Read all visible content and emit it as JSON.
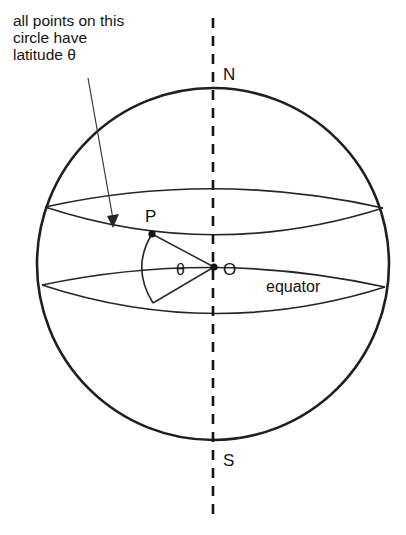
{
  "figure": {
    "type": "geometry-diagram",
    "annotation": {
      "line1": "all points on this",
      "line2": "circle have",
      "line3": "latitude θ"
    },
    "labels": {
      "north_pole": "N",
      "south_pole": "S",
      "point_p": "P",
      "center_o": "O",
      "angle": "θ",
      "equator": "equator"
    },
    "colors": {
      "background": "#ffffff",
      "outline": "#1f1f1f",
      "construction": "#262626",
      "text": "#141414",
      "leader": "#3a3a3a"
    },
    "geometry": {
      "sphere_center_x": 213,
      "sphere_center_y": 264,
      "sphere_radius": 176,
      "axis_x": 213,
      "axis_top_y": 18,
      "axis_bottom_y": 520,
      "point_p_x": 152,
      "point_p_y": 234,
      "center_o_x": 214,
      "center_o_y": 267,
      "lower_point_x": 152,
      "lower_point_y": 303,
      "latitude_left_x": 45,
      "latitude_left_y": 207,
      "latitude_right_x": 383,
      "latitude_right_y": 208,
      "equator_left_x": 42,
      "equator_left_y": 285,
      "equator_right_x": 385,
      "equator_right_y": 287,
      "leader_start_x": 88,
      "leader_start_y": 78,
      "leader_end_x": 113,
      "leader_end_y": 222
    }
  }
}
